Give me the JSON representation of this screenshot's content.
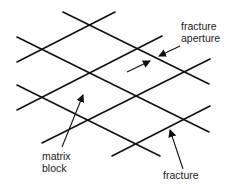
{
  "diagram": {
    "type": "fracture network schematic",
    "line_color": "#111111",
    "text_color": "#1a1a1a",
    "background": "#ffffff",
    "fractures_down_right": [
      {
        "x1": 63,
        "y1": 12,
        "x2": 209,
        "y2": 84
      },
      {
        "x1": 17,
        "y1": 37,
        "x2": 209,
        "y2": 132
      },
      {
        "x1": 17,
        "y1": 85,
        "x2": 160,
        "y2": 156
      }
    ],
    "fractures_up_right": [
      {
        "x1": 17,
        "y1": 62,
        "x2": 115,
        "y2": 12
      },
      {
        "x1": 17,
        "y1": 110,
        "x2": 162,
        "y2": 36
      },
      {
        "x1": 42,
        "y1": 143,
        "x2": 210,
        "y2": 59
      },
      {
        "x1": 112,
        "y1": 156,
        "x2": 210,
        "y2": 106
      }
    ],
    "labels": {
      "aperture_line1": "fracture",
      "aperture_line2": "aperture",
      "matrix_line1": "matrix",
      "matrix_line2": "block",
      "fracture": "fracture"
    },
    "arrows": {
      "aperture_left": {
        "x1": 127,
        "y1": 72,
        "x2": 150,
        "y2": 61
      },
      "aperture_right": {
        "x1": 180,
        "y1": 46,
        "x2": 159,
        "y2": 56
      },
      "matrix_block": {
        "x1": 62,
        "y1": 147,
        "x2": 83,
        "y2": 95
      },
      "fracture": {
        "x1": 183,
        "y1": 169,
        "x2": 170,
        "y2": 130
      }
    }
  }
}
